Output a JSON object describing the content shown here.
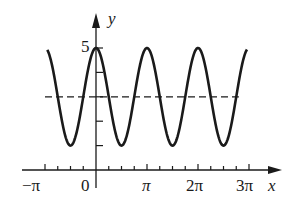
{
  "chart_data": {
    "type": "line",
    "title": "",
    "xlabel": "x",
    "ylabel": "y",
    "function": "y = 3 + 2cos(2x)",
    "x_tick_labels": [
      "−π",
      "0",
      "π",
      "2π",
      "3π"
    ],
    "x_tick_values": [
      -3.14159,
      0,
      3.14159,
      6.28319,
      9.42478
    ],
    "x_minor_tick_step": "π/4",
    "y_tick_labels": [
      "5"
    ],
    "y_tick_values": [
      1,
      2,
      3,
      4,
      5
    ],
    "xlim": [
      -3.3,
      10.2
    ],
    "ylim": [
      0,
      6
    ],
    "grid": false,
    "series": [
      {
        "name": "curve",
        "style": "solid",
        "x_range": [
          -3.0,
          9.3
        ],
        "max": 5,
        "min": 1,
        "period": "π"
      },
      {
        "name": "midline",
        "style": "dashed",
        "value": 3,
        "x_range": [
          -3.14159,
          8.8
        ]
      }
    ],
    "annotations": []
  },
  "labels": {
    "y_axis": "y",
    "x_axis": "x",
    "y_five": "5",
    "neg_pi": "−π",
    "zero": "0",
    "pi": "π",
    "two_pi": "2π",
    "three_pi": "3π"
  }
}
